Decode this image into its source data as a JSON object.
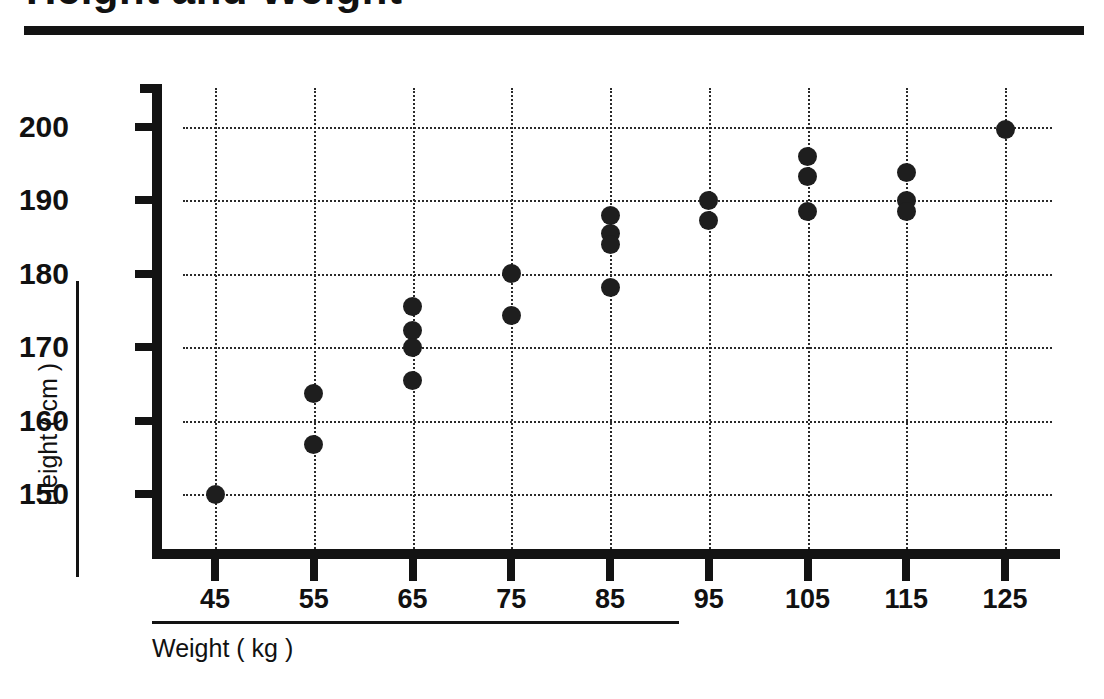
{
  "chart_data": {
    "type": "scatter",
    "title": "Height and Weight",
    "xlabel": "Weight ( kg )",
    "ylabel": "Height ( cm )",
    "xlim": [
      40,
      130
    ],
    "ylim": [
      145,
      205
    ],
    "xticks": [
      45,
      55,
      65,
      75,
      85,
      95,
      105,
      115,
      125
    ],
    "yticks": [
      150,
      160,
      170,
      180,
      190,
      200
    ],
    "grid": true,
    "legend": "none",
    "marker": "filled-circle",
    "marker_color": "#1e1e1e",
    "points": [
      {
        "x": 45,
        "y": 150.0
      },
      {
        "x": 55,
        "y": 163.7
      },
      {
        "x": 55,
        "y": 156.7
      },
      {
        "x": 65,
        "y": 175.5
      },
      {
        "x": 65,
        "y": 172.3
      },
      {
        "x": 65,
        "y": 170.0
      },
      {
        "x": 65,
        "y": 165.5
      },
      {
        "x": 75,
        "y": 180.0
      },
      {
        "x": 75,
        "y": 174.3
      },
      {
        "x": 85,
        "y": 188.0
      },
      {
        "x": 85,
        "y": 185.5
      },
      {
        "x": 85,
        "y": 184.0
      },
      {
        "x": 85,
        "y": 178.2
      },
      {
        "x": 95,
        "y": 190.0
      },
      {
        "x": 95,
        "y": 187.2
      },
      {
        "x": 105,
        "y": 196.0
      },
      {
        "x": 105,
        "y": 193.2
      },
      {
        "x": 105,
        "y": 188.5
      },
      {
        "x": 115,
        "y": 193.8
      },
      {
        "x": 115,
        "y": 190.0
      },
      {
        "x": 115,
        "y": 188.5
      },
      {
        "x": 125,
        "y": 199.7
      }
    ]
  }
}
